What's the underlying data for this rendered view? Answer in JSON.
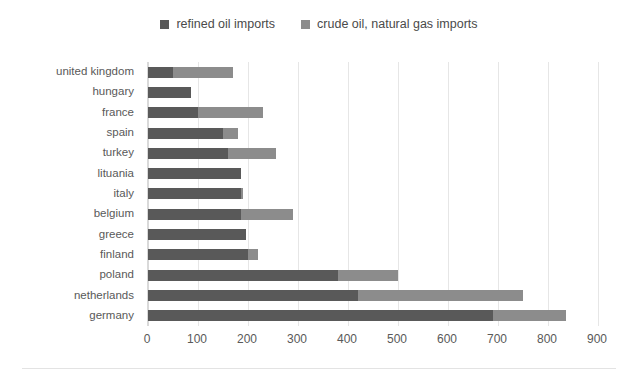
{
  "chart_data": {
    "type": "bar",
    "orientation": "horizontal",
    "stacked": true,
    "title": "",
    "subtitle": "",
    "xlabel": "",
    "ylabel": "",
    "xlim": [
      0,
      900
    ],
    "ylim": null,
    "grid": true,
    "legend_position": "top-center",
    "xticks": [
      0,
      100,
      200,
      300,
      400,
      500,
      600,
      700,
      800,
      900
    ],
    "xtick_labels": [
      "0",
      "100",
      "200",
      "300",
      "400",
      "500",
      "600",
      "700",
      "800",
      "900"
    ],
    "categories": [
      "united kingdom",
      "hungary",
      "france",
      "spain",
      "turkey",
      "lituania",
      "italy",
      "belgium",
      "greece",
      "finland",
      "poland",
      "netherlands",
      "germany"
    ],
    "series": [
      {
        "name": "refined oil imports",
        "color": "#595959",
        "values": [
          50,
          85,
          100,
          150,
          160,
          185,
          185,
          185,
          195,
          200,
          380,
          420,
          690
        ]
      },
      {
        "name": "crude oil, natural gas imports",
        "color": "#8c8c8c",
        "values": [
          120,
          0,
          130,
          30,
          95,
          0,
          5,
          105,
          0,
          20,
          120,
          330,
          145
        ]
      }
    ],
    "totals": [
      170,
      85,
      230,
      180,
      255,
      185,
      190,
      290,
      195,
      220,
      500,
      750,
      835
    ]
  },
  "legend": {
    "entries": [
      {
        "label": "refined oil imports",
        "swatch_name": "legend-swatch-refined-oil-imports"
      },
      {
        "label": "crude oil, natural gas imports",
        "swatch_name": "legend-swatch-crude-oil-natural-gas-imports"
      }
    ]
  },
  "colors": {
    "series_refined": "#595959",
    "series_crude": "#8c8c8c",
    "gridline": "#e6e6e6",
    "axis_line": "#d9d9d9",
    "tick_text": "#595959",
    "legend_text": "#4a4a4a",
    "background": "#ffffff"
  }
}
